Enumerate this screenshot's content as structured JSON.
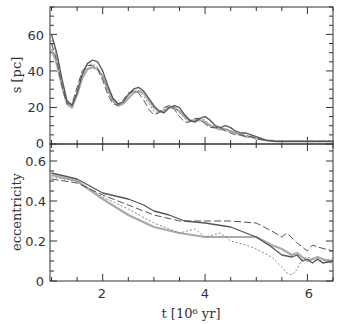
{
  "chart_data": [
    {
      "type": "line",
      "panel": "top",
      "title": "",
      "xlabel": "",
      "ylabel": "s [pc]",
      "xlim": [
        0.97,
        6.5
      ],
      "ylim": [
        0,
        75
      ],
      "grid": false,
      "yticks": [
        0,
        20,
        40,
        60
      ],
      "xticks": [
        2,
        4,
        6
      ],
      "series": [
        {
          "name": "solid-dark",
          "style": "solid",
          "color": "#555555",
          "x": [
            1.0,
            1.1,
            1.2,
            1.3,
            1.4,
            1.5,
            1.6,
            1.7,
            1.8,
            1.9,
            2.0,
            2.1,
            2.2,
            2.3,
            2.4,
            2.5,
            2.6,
            2.7,
            2.8,
            2.9,
            3.0,
            3.1,
            3.2,
            3.3,
            3.4,
            3.5,
            3.6,
            3.7,
            3.8,
            3.9,
            4.0,
            4.1,
            4.2,
            4.3,
            4.4,
            4.5,
            4.6,
            4.7,
            4.8,
            4.9,
            5.0,
            5.2,
            5.4,
            5.6,
            5.8,
            6.0,
            6.2,
            6.5
          ],
          "y": [
            60,
            50,
            36,
            24,
            21,
            28,
            38,
            44,
            46,
            45,
            40,
            32,
            25,
            22,
            23,
            27,
            30,
            31,
            29,
            25,
            21,
            18,
            17,
            20,
            21,
            20,
            16,
            13,
            12,
            14,
            15,
            13,
            10,
            9,
            10,
            9,
            7,
            6,
            6,
            5,
            4,
            2,
            1.5,
            1.5,
            1.5,
            1.5,
            1.5,
            1.5
          ]
        },
        {
          "name": "dashed-dark",
          "style": "dashed",
          "color": "#555555",
          "x": [
            1.0,
            1.1,
            1.2,
            1.3,
            1.4,
            1.5,
            1.6,
            1.7,
            1.8,
            1.9,
            2.0,
            2.1,
            2.2,
            2.3,
            2.4,
            2.5,
            2.6,
            2.7,
            2.8,
            2.9,
            3.0,
            3.1,
            3.2,
            3.3,
            3.4,
            3.5,
            3.6,
            3.7,
            3.8,
            3.9,
            4.0,
            4.1,
            4.2,
            4.3,
            4.4,
            4.5,
            4.6,
            4.7,
            4.8,
            4.9,
            5.0,
            5.2,
            5.4,
            5.6,
            5.8,
            6.0,
            6.2,
            6.5
          ],
          "y": [
            55,
            46,
            32,
            22,
            22,
            31,
            40,
            43,
            43,
            41,
            35,
            27,
            22,
            21,
            24,
            28,
            29,
            28,
            24,
            19,
            16,
            17,
            20,
            21,
            19,
            15,
            12,
            12,
            14,
            14,
            11,
            9,
            9,
            9,
            7,
            6,
            5,
            5,
            4,
            4,
            3,
            2,
            1.5,
            1.5,
            1.5,
            1.5,
            1.5,
            1.5
          ]
        },
        {
          "name": "dotted-gray",
          "style": "dotted",
          "color": "#888888",
          "x": [
            1.0,
            1.1,
            1.2,
            1.3,
            1.4,
            1.5,
            1.6,
            1.7,
            1.8,
            1.9,
            2.0,
            2.1,
            2.2,
            2.3,
            2.4,
            2.5,
            2.6,
            2.7,
            2.8,
            2.9,
            3.0,
            3.1,
            3.2,
            3.3,
            3.4,
            3.5,
            3.6,
            3.7,
            3.8,
            3.9,
            4.0,
            4.1,
            4.2,
            4.3,
            4.4,
            4.5,
            4.6,
            4.7,
            4.8,
            4.9,
            5.0,
            5.2,
            5.4,
            5.6,
            5.8,
            6.0,
            6.2,
            6.5
          ],
          "y": [
            57,
            48,
            34,
            23,
            21,
            29,
            39,
            43,
            44,
            42,
            37,
            29,
            23,
            21,
            23,
            27,
            29,
            29,
            26,
            22,
            18,
            17,
            19,
            21,
            20,
            17,
            14,
            12,
            13,
            14,
            13,
            10,
            9,
            9,
            8,
            7,
            6,
            5,
            5,
            4,
            3,
            2,
            1.5,
            1.5,
            1.5,
            1.5,
            1.5,
            1.5
          ]
        },
        {
          "name": "solid-light",
          "style": "solid-thick",
          "color": "#aaaaaa",
          "x": [
            1.0,
            1.1,
            1.2,
            1.3,
            1.4,
            1.5,
            1.6,
            1.7,
            1.8,
            1.9,
            2.0,
            2.1,
            2.2,
            2.3,
            2.4,
            2.5,
            2.6,
            2.7,
            2.8,
            2.9,
            3.0,
            3.1,
            3.2,
            3.3,
            3.4,
            3.5,
            3.6,
            3.7,
            3.8,
            3.9,
            4.0,
            4.1,
            4.2,
            4.3,
            4.4,
            4.5,
            4.6,
            4.7,
            4.8,
            4.9,
            5.0,
            5.2,
            5.4,
            5.6,
            5.8,
            6.0,
            6.2,
            6.5
          ],
          "y": [
            52,
            44,
            32,
            22,
            20,
            27,
            36,
            41,
            42,
            41,
            37,
            30,
            24,
            21,
            22,
            25,
            28,
            29,
            28,
            24,
            20,
            18,
            18,
            20,
            20,
            18,
            15,
            13,
            13,
            13,
            12,
            10,
            9,
            8,
            8,
            7,
            6,
            5,
            4,
            4,
            3,
            2,
            1.5,
            1.5,
            1.5,
            1.5,
            1.5,
            1.5
          ]
        }
      ]
    },
    {
      "type": "line",
      "panel": "bottom",
      "title": "",
      "xlabel": "t [10⁶ yr]",
      "ylabel": "eccentricity",
      "xlim": [
        0.97,
        6.5
      ],
      "ylim": [
        0,
        0.685
      ],
      "grid": false,
      "yticks": [
        0,
        0.2,
        0.4,
        0.6
      ],
      "xticks": [
        2,
        4,
        6
      ],
      "series": [
        {
          "name": "solid-dark",
          "style": "solid",
          "color": "#555555",
          "x": [
            1.0,
            1.5,
            2.0,
            2.5,
            2.8,
            3.0,
            3.3,
            3.6,
            4.0,
            4.5,
            5.0,
            5.3,
            5.5,
            5.7,
            5.8,
            5.9,
            6.0,
            6.1,
            6.2,
            6.3,
            6.5
          ],
          "y": [
            0.54,
            0.51,
            0.44,
            0.41,
            0.38,
            0.35,
            0.33,
            0.3,
            0.29,
            0.27,
            0.22,
            0.17,
            0.13,
            0.12,
            0.13,
            0.1,
            0.11,
            0.09,
            0.11,
            0.09,
            0.1
          ]
        },
        {
          "name": "dashed-dark",
          "style": "dashed",
          "color": "#555555",
          "x": [
            1.0,
            1.5,
            2.0,
            2.5,
            3.0,
            3.5,
            4.0,
            4.5,
            5.0,
            5.3,
            5.5,
            5.6,
            5.8,
            6.0,
            6.1,
            6.2,
            6.5
          ],
          "y": [
            0.51,
            0.49,
            0.43,
            0.38,
            0.33,
            0.3,
            0.3,
            0.3,
            0.29,
            0.25,
            0.22,
            0.24,
            0.19,
            0.15,
            0.18,
            0.17,
            0.15
          ]
        },
        {
          "name": "dotted-gray",
          "style": "dotted",
          "color": "#888888",
          "x": [
            1.0,
            1.5,
            2.0,
            2.5,
            3.0,
            3.3,
            3.5,
            3.8,
            4.0,
            4.3,
            4.5,
            4.8,
            5.0,
            5.3,
            5.5,
            5.6,
            5.7,
            5.8,
            5.9,
            6.0,
            6.2,
            6.5
          ],
          "y": [
            0.52,
            0.5,
            0.42,
            0.36,
            0.29,
            0.26,
            0.24,
            0.26,
            0.22,
            0.24,
            0.2,
            0.18,
            0.16,
            0.12,
            0.07,
            0.04,
            0.03,
            0.06,
            0.11,
            0.12,
            0.1,
            0.11
          ]
        },
        {
          "name": "solid-light",
          "style": "solid-thick",
          "color": "#aaaaaa",
          "x": [
            1.0,
            1.5,
            2.0,
            2.5,
            3.0,
            3.5,
            4.0,
            4.5,
            5.0,
            5.3,
            5.5,
            5.7,
            5.8,
            5.9,
            6.0,
            6.2,
            6.5
          ],
          "y": [
            0.53,
            0.5,
            0.41,
            0.33,
            0.27,
            0.24,
            0.22,
            0.22,
            0.22,
            0.18,
            0.16,
            0.13,
            0.14,
            0.12,
            0.1,
            0.12,
            0.09
          ]
        }
      ]
    }
  ],
  "axes": {
    "top": {
      "ylabel": "s [pc]",
      "yticks": [
        "0",
        "20",
        "40",
        "60"
      ]
    },
    "bottom": {
      "ylabel": "eccentricity",
      "yticks": [
        "0",
        "0.2",
        "0.4",
        "0.6"
      ],
      "xlabel": "t [10⁶ yr]",
      "xticks": [
        "2",
        "4",
        "6"
      ]
    }
  }
}
